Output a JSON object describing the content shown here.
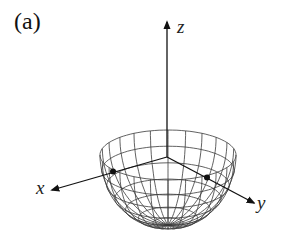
{
  "figure": {
    "panel_label": "(a)",
    "axes": {
      "x": {
        "label": "x"
      },
      "y": {
        "label": "y"
      },
      "z": {
        "label": "z"
      }
    },
    "surface": {
      "type": "lower-hemisphere",
      "meridians": 24,
      "parallels": 7
    },
    "marked_points": [
      {
        "name": "x-axis-rim-point"
      },
      {
        "name": "y-axis-rim-point"
      }
    ],
    "colors": {
      "line": "#222222",
      "mesh": "#3a3a3a",
      "background": "#ffffff"
    }
  }
}
